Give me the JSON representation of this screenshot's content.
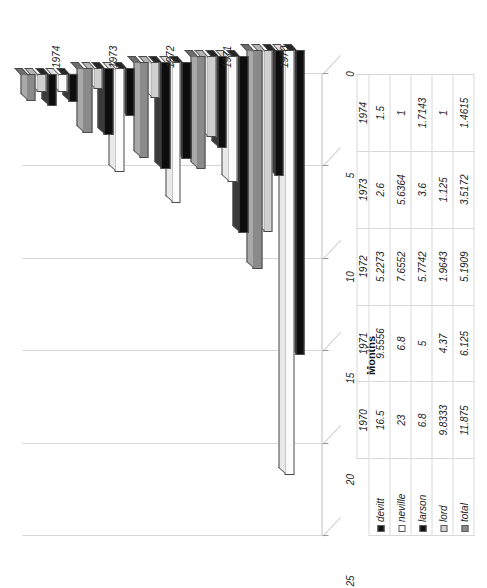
{
  "chart_data": {
    "type": "bar",
    "title": "",
    "subtitle": "",
    "orientation": "horizontal-3d",
    "xlabel": "",
    "ylabel": "Months",
    "categories": [
      "1970",
      "1971",
      "1972",
      "1973",
      "1974"
    ],
    "series": [
      {
        "name": "devitt",
        "color": "#0d0d0d",
        "values": [
          16.5,
          9.5556,
          5.2273,
          2.6,
          1.5
        ]
      },
      {
        "name": "neville",
        "color": "#fbfbfb",
        "values": [
          23,
          6.8,
          7.6552,
          5.6364,
          1
        ]
      },
      {
        "name": "larson",
        "color": "#0d0d0d",
        "values": [
          6.8,
          5,
          5.7742,
          3.6,
          1.7143
        ]
      },
      {
        "name": "lord",
        "color": "#cfcfcf",
        "values": [
          9.8333,
          4.37,
          1.9643,
          1.125,
          1
        ]
      },
      {
        "name": "total",
        "color": "#8a8a8a",
        "values": [
          11.875,
          6.125,
          5.1909,
          3.5172,
          1.4615
        ]
      }
    ],
    "value_ticks": [
      "0",
      "5",
      "10",
      "15",
      "20",
      "25"
    ],
    "value_tick_values": [
      0,
      5,
      10,
      15,
      20,
      25
    ],
    "xlim": [
      0,
      25
    ],
    "grid": true,
    "legend_position": "table-row-headers",
    "axis_title_months": "Months"
  },
  "table": {
    "year_header": [
      "1970",
      "1971",
      "1972",
      "1973",
      "1974"
    ],
    "rows": [
      {
        "label": "devitt",
        "swatch": "devitt-swatch",
        "cells": [
          "16.5",
          "9.5556",
          "5.2273",
          "2.6",
          "1.5"
        ]
      },
      {
        "label": "neville",
        "swatch": "neville-swatch",
        "cells": [
          "23",
          "6.8",
          "7.6552",
          "5.6364",
          "1"
        ]
      },
      {
        "label": "larson",
        "swatch": "larson-swatch",
        "cells": [
          "6.8",
          "5",
          "5.7742",
          "3.6",
          "1.7143"
        ]
      },
      {
        "label": "lord",
        "swatch": "lord-swatch",
        "cells": [
          "9.8333",
          "4.37",
          "1.9643",
          "1.125",
          "1"
        ]
      },
      {
        "label": "total",
        "swatch": "total-swatch",
        "cells": [
          "11.875",
          "6.125",
          "5.1909",
          "3.5172",
          "1.4615"
        ]
      }
    ]
  }
}
